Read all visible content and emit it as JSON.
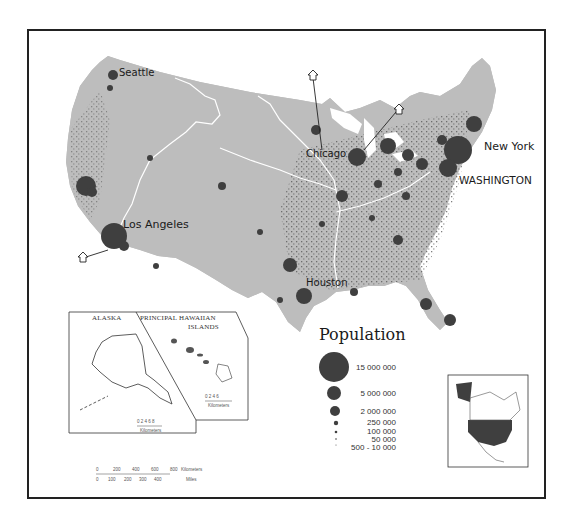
{
  "map": {
    "title": "Population",
    "land_color": "#bdbdbd",
    "dot_color": "#4a4a4a",
    "city_color": "#3d3d3d",
    "river_color": "#ffffff"
  },
  "cities": [
    {
      "name": "Seattle",
      "label": "Seattle"
    },
    {
      "name": "Chicago",
      "label": "Chicago"
    },
    {
      "name": "New York",
      "label": "New York"
    },
    {
      "name": "Washington",
      "label": "WASHINGTON"
    },
    {
      "name": "Los Angeles",
      "label": "Los Angeles"
    },
    {
      "name": "Houston",
      "label": "Houston"
    }
  ],
  "legend": {
    "title": "Population",
    "items": [
      {
        "label": "15 000 000"
      },
      {
        "label": "5 000 000"
      },
      {
        "label": "2 000 000"
      },
      {
        "label": "250 000"
      },
      {
        "label": "100 000"
      },
      {
        "label": "50 000"
      },
      {
        "label": "500 - 10 000"
      }
    ]
  },
  "insets": {
    "alaska": {
      "title": "ALASKA",
      "scale_ticks": "0 2 4 6 8",
      "scale_unit": "Kilometers"
    },
    "hawaii": {
      "title_line1": "PRINCIPAL HAWAIIAN",
      "title_line2": "ISLANDS",
      "scale_ticks": "0 2 4 6",
      "scale_unit": "Kilometers"
    },
    "locator": {
      "label": "North America locator"
    }
  },
  "scale_bar": {
    "km_ticks": [
      "0",
      "200",
      "400",
      "600",
      "800"
    ],
    "km_unit": "Kilometers",
    "mi_ticks": [
      "0",
      "100",
      "200",
      "300",
      "400"
    ],
    "mi_unit": "Miles"
  }
}
